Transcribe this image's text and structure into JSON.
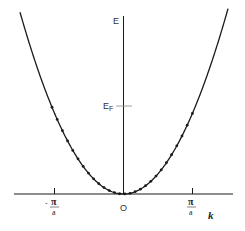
{
  "diagram": {
    "type": "band-dispersion",
    "axes": {
      "x_label": "k",
      "y_label": "E",
      "origin_label": "O"
    },
    "ticks": {
      "neg_pi_a": {
        "sign": "-",
        "numerator": "π",
        "denominator": "a"
      },
      "pos_pi_a": {
        "numerator": "π",
        "denominator": "a"
      }
    },
    "fermi_level": {
      "label": "E",
      "subscript": "F"
    },
    "colors": {
      "line": "#1a1a1a",
      "dots": "#1a1a1a",
      "tick_fermi": "#888888",
      "text": "#333333"
    }
  }
}
